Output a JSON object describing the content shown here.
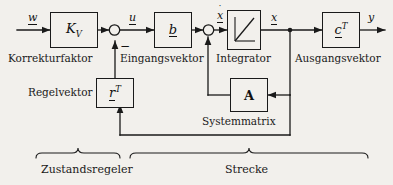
{
  "diagram": {
    "background_color": "#f2f0ec",
    "line_color": "#1a1a1a",
    "blocks": [
      {
        "id": "kv",
        "label_plain": "KV",
        "name": "block-kv",
        "caption": "Korrekturfaktor"
      },
      {
        "id": "b",
        "label_plain": "b",
        "name": "block-b",
        "caption": "Eingangsvektor"
      },
      {
        "id": "integrator",
        "label_plain": "",
        "name": "block-integrator",
        "caption": "Integrator"
      },
      {
        "id": "ct",
        "label_plain": "cT",
        "name": "block-ct",
        "caption": "Ausgangsvektor"
      },
      {
        "id": "a",
        "label_plain": "A",
        "name": "block-a",
        "caption": "Systemmatrix"
      },
      {
        "id": "rt",
        "label_plain": "rT",
        "name": "block-rt",
        "caption": "Regelvektor"
      }
    ],
    "captions": {
      "korrekturfaktor": "Korrekturfaktor",
      "eingangsvektor": "Eingangsvektor",
      "integrator": "Integrator",
      "ausgangsvektor": "Ausgangsvektor",
      "systemmatrix": "Systemmatrix",
      "regelvektor": "Regelvektor"
    },
    "signals": {
      "w": "w",
      "u": "u",
      "xdot": "x",
      "x": "x",
      "y": "y"
    },
    "block_text": {
      "kv_base": "K",
      "kv_sub": "V",
      "b": "b",
      "c_base": "c",
      "c_sup": "T",
      "r_base": "r",
      "r_sup": "T",
      "a": "A"
    },
    "sum_sign": "−",
    "braces": [
      {
        "id": "zustandsregeler",
        "label": "Zustandsregeler",
        "name": "brace-zustandsregeler"
      },
      {
        "id": "strecke",
        "label": "Strecke",
        "name": "brace-strecke"
      }
    ],
    "brace_labels": {
      "zustandsregeler": "Zustandsregeler",
      "strecke": "Strecke"
    },
    "icons": {
      "sum_junction": "sum-junction-icon",
      "integrator_ramp": "integrator-ramp-icon",
      "arrow": "arrow-head-icon"
    }
  }
}
